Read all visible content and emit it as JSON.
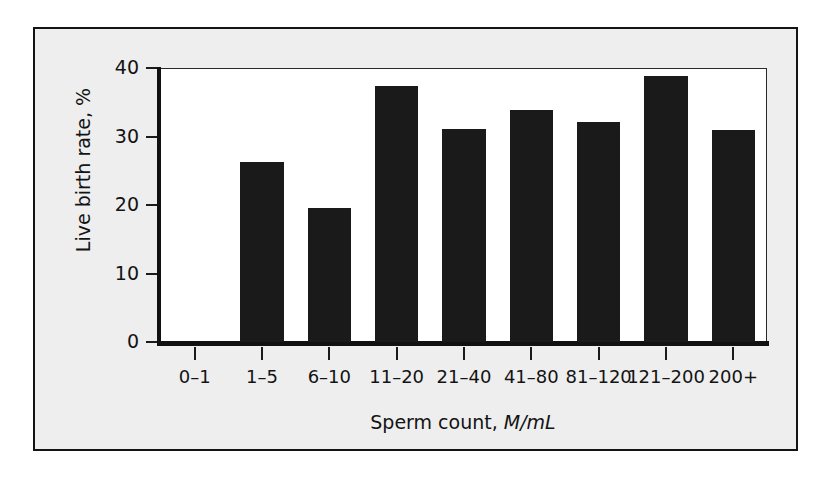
{
  "chart_data": {
    "type": "bar",
    "title": "",
    "subtitle": "",
    "xlabel": "Sperm count, M/mL",
    "xlabel_main": "Sperm count,",
    "xlabel_unit": "M/mL",
    "ylabel": "Live birth rate, %",
    "categories": [
      "0–1",
      "1–5",
      "6–10",
      "11–20",
      "21–40",
      "41–80",
      "81–120",
      "121–200",
      "200+"
    ],
    "values": [
      0,
      26.3,
      19.5,
      37.4,
      31.1,
      33.9,
      32.1,
      38.8,
      30.9
    ],
    "ylim": [
      0,
      40
    ],
    "yticks": [
      0,
      10,
      20,
      30,
      40
    ],
    "ytick_labels": [
      "0",
      "10",
      "20",
      "30",
      "40"
    ],
    "grid": false,
    "legend": false,
    "bar_color": "#1a1a1a",
    "plot_background": "#ffffff",
    "figure_background": "#eeeeee",
    "axis_color": "#111111"
  }
}
